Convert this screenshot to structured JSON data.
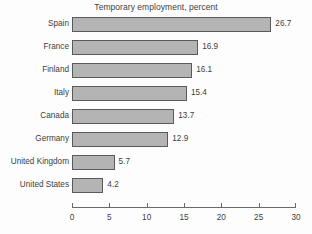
{
  "chart_data": {
    "type": "bar",
    "orientation": "horizontal",
    "title": "Temporary employment, percent",
    "xlabel": "",
    "ylabel": "",
    "categories": [
      "Spain",
      "France",
      "Finland",
      "Italy",
      "Canada",
      "Germany",
      "United Kingdom",
      "United States"
    ],
    "values": [
      26.7,
      16.9,
      16.1,
      15.4,
      13.7,
      12.9,
      5.7,
      4.2
    ],
    "value_labels": [
      "26.7",
      "16.9",
      "16.1",
      "15.4",
      "13.7",
      "12.9",
      "5.7",
      "4.2"
    ],
    "xlim": [
      0,
      30
    ],
    "xticks": [
      0,
      5,
      10,
      15,
      20,
      25,
      30
    ],
    "xtick_labels": [
      "0",
      "5",
      "10",
      "15",
      "20",
      "25",
      "30"
    ],
    "grid": false,
    "legend": false,
    "bar_fill_color": "#b4b4b4",
    "bar_border_color": "#5a5a5a",
    "text_color": "#3d3d3d",
    "background_color": "#ffffff"
  }
}
